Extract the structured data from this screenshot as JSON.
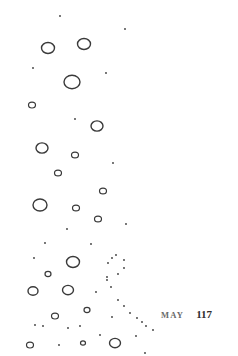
{
  "page": {
    "background": "#ffffff",
    "ink_color": "#3a3a3a"
  },
  "footer": {
    "month": "MAY",
    "page_number": "117"
  },
  "illustration": {
    "subject": "bubbles",
    "circles": [
      {
        "cx": 48,
        "cy": 48,
        "r": 6.5
      },
      {
        "cx": 84,
        "cy": 44,
        "r": 6.5
      },
      {
        "cx": 72,
        "cy": 82,
        "r": 8
      },
      {
        "cx": 32,
        "cy": 105,
        "r": 3.5
      },
      {
        "cx": 97,
        "cy": 126,
        "r": 6
      },
      {
        "cx": 42,
        "cy": 148,
        "r": 6
      },
      {
        "cx": 75,
        "cy": 155,
        "r": 3.5
      },
      {
        "cx": 58,
        "cy": 173,
        "r": 3.5
      },
      {
        "cx": 103,
        "cy": 191,
        "r": 3.5
      },
      {
        "cx": 40,
        "cy": 205,
        "r": 7
      },
      {
        "cx": 76,
        "cy": 208,
        "r": 3.5
      },
      {
        "cx": 98,
        "cy": 219,
        "r": 3.5
      },
      {
        "cx": 73,
        "cy": 262,
        "r": 6.5
      },
      {
        "cx": 48,
        "cy": 274,
        "r": 3
      },
      {
        "cx": 33,
        "cy": 291,
        "r": 5
      },
      {
        "cx": 68,
        "cy": 290,
        "r": 5.5
      },
      {
        "cx": 55,
        "cy": 316,
        "r": 3.5
      },
      {
        "cx": 87,
        "cy": 310,
        "r": 3
      },
      {
        "cx": 30,
        "cy": 345,
        "r": 3.5
      },
      {
        "cx": 83,
        "cy": 343,
        "r": 2.5
      },
      {
        "cx": 115,
        "cy": 343,
        "r": 5.5
      }
    ],
    "dots": [
      [
        60,
        16
      ],
      [
        125,
        29
      ],
      [
        33,
        68
      ],
      [
        106,
        73
      ],
      [
        75,
        119
      ],
      [
        113,
        163
      ],
      [
        67,
        229
      ],
      [
        126,
        224
      ],
      [
        45,
        243
      ],
      [
        91,
        244
      ],
      [
        34,
        258
      ],
      [
        112,
        258
      ],
      [
        107,
        277
      ],
      [
        118,
        274
      ],
      [
        124,
        260
      ],
      [
        108,
        263
      ],
      [
        116,
        255
      ],
      [
        124,
        268
      ],
      [
        96,
        292
      ],
      [
        111,
        287
      ],
      [
        107,
        280
      ],
      [
        118,
        300
      ],
      [
        124,
        306
      ],
      [
        130,
        313
      ],
      [
        137,
        318
      ],
      [
        142,
        322
      ],
      [
        146,
        326
      ],
      [
        153,
        330
      ],
      [
        35,
        325
      ],
      [
        43,
        326
      ],
      [
        68,
        328
      ],
      [
        80,
        326
      ],
      [
        112,
        317
      ],
      [
        100,
        335
      ],
      [
        59,
        345
      ],
      [
        136,
        336
      ],
      [
        145,
        353
      ]
    ]
  }
}
